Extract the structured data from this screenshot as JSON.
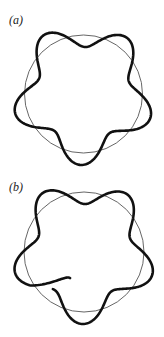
{
  "figure": {
    "panels": [
      {
        "id": "a",
        "label": "(a)",
        "reference_circle": {
          "cx": 83.5,
          "cy": 94,
          "r": 59
        },
        "wave": {
          "lobes": 5,
          "amplitude": 12,
          "phase_deg": 100,
          "closed": true
        },
        "colors": {
          "circle": "#555555",
          "wave": "#111111"
        }
      },
      {
        "id": "b",
        "label": "(b)",
        "reference_circle": {
          "cx": 84,
          "cy": 84,
          "r": 60
        },
        "wave": {
          "lobes": 5,
          "amplitude": 12,
          "phase_deg": 95,
          "closed": false,
          "start_deg": 118,
          "sweep_deg": 372,
          "start_r_offset": -22
        },
        "colors": {
          "circle": "#555555",
          "wave": "#111111"
        }
      }
    ]
  }
}
